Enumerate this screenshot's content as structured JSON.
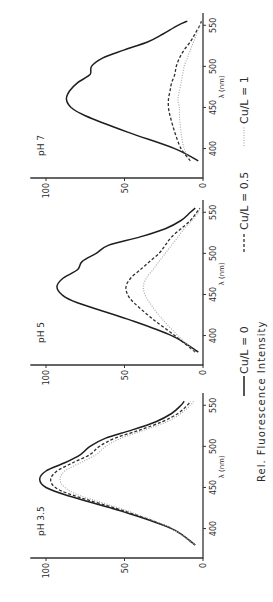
{
  "chart_data": {
    "type": "line",
    "title": "",
    "ylabel": "Rel. Fluorescence Intensity",
    "xlabel": "λ (nm)",
    "xlim": [
      370,
      560
    ],
    "ylim": [
      0,
      110
    ],
    "x_ticks": [
      "400",
      "450",
      "500",
      "550"
    ],
    "y_ticks": [
      "0",
      "50",
      "100"
    ],
    "grid": false,
    "legend_position": "bottom",
    "legend": [
      {
        "label": "Cu/L = 0",
        "style": "solid",
        "color": "#222222"
      },
      {
        "label": "Cu/L = 0.5",
        "style": "dashed",
        "color": "#333333"
      },
      {
        "label": "Cu/L = 1",
        "style": "dotted",
        "color": "#9a9a9a"
      }
    ],
    "panels": [
      {
        "label": "pH 3.5",
        "x": [
          380,
          400,
          420,
          440,
          450,
          460,
          470,
          480,
          490,
          500,
          510,
          520,
          530,
          540,
          550,
          555
        ],
        "series": [
          {
            "name": "Cu/L = 0",
            "values": [
              5,
              20,
              50,
              86,
              100,
              104,
              100,
              88,
              78,
              72,
              62,
              45,
              30,
              20,
              14,
              12
            ]
          },
          {
            "name": "Cu/L = 0.5",
            "values": [
              5,
              20,
              48,
              82,
              94,
              97,
              93,
              83,
              72,
              66,
              56,
              40,
              26,
              16,
              10,
              8
            ]
          },
          {
            "name": "Cu/L = 1",
            "values": [
              5,
              20,
              46,
              78,
              88,
              91,
              88,
              78,
              68,
              62,
              52,
              37,
              23,
              14,
              8,
              6
            ]
          }
        ]
      },
      {
        "label": "pH 5",
        "x": [
          380,
          400,
          420,
          440,
          450,
          460,
          470,
          480,
          490,
          500,
          510,
          520,
          530,
          540,
          550,
          555
        ],
        "series": [
          {
            "name": "Cu/L = 0",
            "values": [
              3,
              20,
              48,
              80,
              90,
              93,
              89,
              80,
              77,
              68,
              60,
              40,
              24,
              14,
              8,
              5
            ]
          },
          {
            "name": "Cu/L = 0.5",
            "values": [
              5,
              18,
              32,
              44,
              48,
              49,
              46,
              40,
              34,
              28,
              24,
              20,
              14,
              8,
              4,
              2
            ]
          },
          {
            "name": "Cu/L = 1",
            "values": [
              5,
              16,
              26,
              34,
              37,
              38,
              36,
              32,
              28,
              24,
              20,
              16,
              12,
              7,
              3,
              2
            ]
          }
        ]
      },
      {
        "label": "pH 7",
        "x": [
          385,
          400,
          420,
          440,
          450,
          460,
          470,
          480,
          490,
          500,
          510,
          520,
          530,
          540,
          550,
          555
        ],
        "series": [
          {
            "name": "Cu/L = 0",
            "values": [
              3,
              18,
              48,
              75,
              84,
              87,
              85,
              80,
              72,
              71,
              64,
              50,
              35,
              25,
              16,
              10
            ]
          },
          {
            "name": "Cu/L = 0.5",
            "values": [
              8,
              14,
              18,
              21,
              22,
              22,
              21,
              20,
              18,
              17,
              15,
              12,
              8,
              5,
              2,
              1
            ]
          },
          {
            "name": "Cu/L = 1",
            "values": [
              8,
              12,
              14,
              15,
              15,
              16,
              15,
              14,
              13,
              12,
              10,
              8,
              6,
              4,
              2,
              1
            ]
          }
        ]
      }
    ]
  }
}
